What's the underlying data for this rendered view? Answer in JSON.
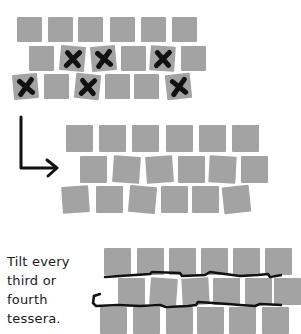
{
  "caption": {
    "lines": [
      "Tilt every",
      "third or",
      "fourth",
      "tessera."
    ]
  },
  "colors": {
    "tile": "#a3a3a3",
    "ink": "#111111",
    "background": "#ffffff"
  },
  "panels": [
    {
      "name": "marked-tiles",
      "description": "Grid of tesserae with X marks on tiles to tilt",
      "rows": [
        {
          "tiles": [
            {
              "x": 17,
              "y": 17,
              "r": 0
            },
            {
              "x": 48,
              "y": 17,
              "r": 0
            },
            {
              "x": 78,
              "y": 17,
              "r": 0
            },
            {
              "x": 110,
              "y": 17,
              "r": 0
            },
            {
              "x": 141,
              "y": 17,
              "r": 0
            },
            {
              "x": 172,
              "y": 17,
              "r": 0
            }
          ]
        },
        {
          "tiles": [
            {
              "x": 29,
              "y": 46,
              "r": 0
            },
            {
              "x": 60,
              "y": 46,
              "r": 5,
              "x_mark": true
            },
            {
              "x": 91,
              "y": 46,
              "r": -5,
              "x_mark": true
            },
            {
              "x": 121,
              "y": 46,
              "r": 0
            },
            {
              "x": 150,
              "y": 46,
              "r": 4,
              "x_mark": true
            },
            {
              "x": 181,
              "y": 46,
              "r": 0
            }
          ]
        },
        {
          "tiles": [
            {
              "x": 13,
              "y": 74,
              "r": -5,
              "x_mark": true
            },
            {
              "x": 44,
              "y": 74,
              "r": 0
            },
            {
              "x": 75,
              "y": 74,
              "r": 6,
              "x_mark": true
            },
            {
              "x": 105,
              "y": 74,
              "r": 0
            },
            {
              "x": 134,
              "y": 74,
              "r": 0
            },
            {
              "x": 166,
              "y": 74,
              "r": -6,
              "x_mark": true
            }
          ]
        }
      ]
    },
    {
      "name": "tilted-tiles",
      "description": "Same grid with marked tesserae rotated slightly",
      "rows": [
        {
          "tiles": [
            {
              "x": 66,
              "y": 125,
              "r": 0
            },
            {
              "x": 99,
              "y": 125,
              "r": 0
            },
            {
              "x": 132,
              "y": 125,
              "r": 0
            },
            {
              "x": 166,
              "y": 125,
              "r": 0
            },
            {
              "x": 199,
              "y": 125,
              "r": 0
            },
            {
              "x": 232,
              "y": 125,
              "r": 0
            }
          ]
        },
        {
          "tiles": [
            {
              "x": 80,
              "y": 156,
              "r": 0
            },
            {
              "x": 113,
              "y": 156,
              "r": 4
            },
            {
              "x": 146,
              "y": 156,
              "r": -4
            },
            {
              "x": 178,
              "y": 156,
              "r": 0
            },
            {
              "x": 209,
              "y": 156,
              "r": 3
            },
            {
              "x": 241,
              "y": 156,
              "r": 0
            }
          ]
        },
        {
          "tiles": [
            {
              "x": 62,
              "y": 186,
              "r": -4
            },
            {
              "x": 96,
              "y": 186,
              "r": 0
            },
            {
              "x": 129,
              "y": 186,
              "r": 5
            },
            {
              "x": 161,
              "y": 186,
              "r": 0
            },
            {
              "x": 192,
              "y": 186,
              "r": 0
            },
            {
              "x": 223,
              "y": 186,
              "r": -6
            }
          ]
        }
      ]
    },
    {
      "name": "flow-lines",
      "description": "Tilted tiles with wavy black lines showing andamento",
      "rows": [
        {
          "tiles": [
            {
              "x": 104,
              "y": 248,
              "r": 0
            },
            {
              "x": 137,
              "y": 248,
              "r": 0
            },
            {
              "x": 169,
              "y": 248,
              "r": 0
            },
            {
              "x": 201,
              "y": 248,
              "r": 0
            },
            {
              "x": 233,
              "y": 248,
              "r": 0
            },
            {
              "x": 265,
              "y": 248,
              "r": 0
            }
          ]
        },
        {
          "tiles": [
            {
              "x": 118,
              "y": 278,
              "r": 0
            },
            {
              "x": 150,
              "y": 278,
              "r": 4
            },
            {
              "x": 182,
              "y": 278,
              "r": -3
            },
            {
              "x": 213,
              "y": 278,
              "r": 0
            },
            {
              "x": 245,
              "y": 278,
              "r": 0
            },
            {
              "x": 274,
              "y": 278,
              "r": 0
            }
          ]
        },
        {
          "tiles": [
            {
              "x": 100,
              "y": 307,
              "r": 0
            },
            {
              "x": 133,
              "y": 307,
              "r": 0
            },
            {
              "x": 166,
              "y": 307,
              "r": 0
            },
            {
              "x": 197,
              "y": 307,
              "r": 0
            },
            {
              "x": 229,
              "y": 307,
              "r": 0
            },
            {
              "x": 262,
              "y": 307,
              "r": 0
            }
          ]
        }
      ]
    }
  ]
}
